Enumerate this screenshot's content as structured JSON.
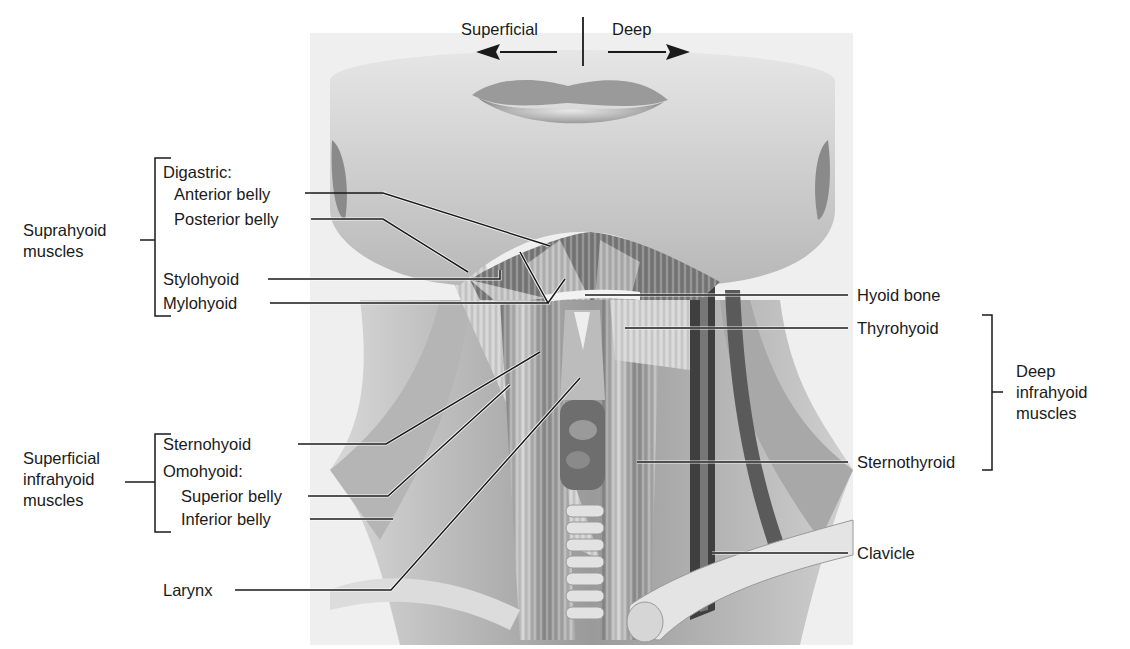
{
  "orientation": {
    "left_label": "Superficial",
    "right_label": "Deep"
  },
  "groups": {
    "suprahyoid": {
      "line1": "Suprahyoid",
      "line2": "muscles"
    },
    "superficial_infrahyoid": {
      "line1": "Superficial",
      "line2": "infrahyoid",
      "line3": "muscles"
    },
    "deep_infrahyoid": {
      "line1": "Deep",
      "line2": "infrahyoid",
      "line3": "muscles"
    }
  },
  "labels": {
    "digastric": "Digastric:",
    "anterior_belly": "Anterior belly",
    "posterior_belly": "Posterior belly",
    "stylohyoid": "Stylohyoid",
    "mylohyoid": "Mylohyoid",
    "sternohyoid": "Sternohyoid",
    "omohyoid": "Omohyoid:",
    "superior_belly": "Superior belly",
    "inferior_belly": "Inferior belly",
    "larynx": "Larynx",
    "hyoid_bone": "Hyoid bone",
    "thyrohyoid": "Thyrohyoid",
    "sternothyroid": "Sternothyroid",
    "clavicle": "Clavicle"
  },
  "colors": {
    "background": "#ffffff",
    "illustration_bg": "#eeeeee",
    "skin": "#c9c9c9",
    "muscle_dark": "#5a5a5a",
    "muscle_mid": "#8c8c8c",
    "leader_line": "#1a1a1a",
    "leader_highlight": "#ffffff"
  }
}
